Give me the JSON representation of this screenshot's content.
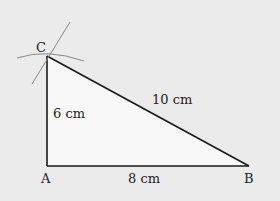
{
  "diagram": {
    "colors": {
      "background": "#ebebeb",
      "triangle_fill": "#f8f8f8",
      "edge": "#1a1a1a",
      "construction": "#888888"
    },
    "vertices": {
      "A": {
        "label": "A",
        "x": 47,
        "y": 166
      },
      "B": {
        "label": "B",
        "x": 249,
        "y": 166
      },
      "C": {
        "label": "C",
        "x": 47,
        "y": 56
      }
    },
    "sides": {
      "AC": {
        "label": "6 cm"
      },
      "AB": {
        "label": "8 cm"
      },
      "BC": {
        "label": "10 cm"
      }
    }
  }
}
